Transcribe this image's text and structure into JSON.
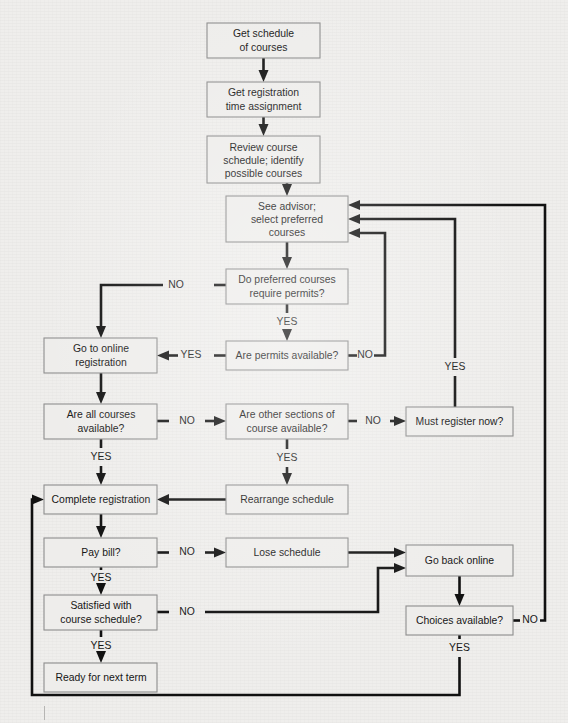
{
  "figure": {
    "type": "flowchart",
    "background_color": "#efeeec",
    "box_fill_color": "#eeedeb",
    "box_border_color": "#8d8d8d",
    "line_color": "#111111",
    "text_color": "#161616"
  },
  "nodes": [
    {
      "id": "get_schedule",
      "label": "Get schedule\nof courses",
      "lines": [
        "Get schedule",
        "of courses"
      ],
      "x": 207,
      "y": 23,
      "w": 113,
      "h": 35
    },
    {
      "id": "get_registration",
      "label": "Get registration\ntime assignment",
      "lines": [
        "Get registration",
        "time assignment"
      ],
      "x": 207,
      "y": 82,
      "w": 113,
      "h": 35
    },
    {
      "id": "review_course",
      "label": "Review  course\nschedule; identify\npossible courses",
      "lines": [
        "Review  course",
        "schedule; identify",
        "possible courses"
      ],
      "x": 207,
      "y": 136,
      "w": 113,
      "h": 47
    },
    {
      "id": "see_advisor",
      "label": "See advisor;\nselect preferred\ncourses",
      "lines": [
        "See advisor;",
        "select preferred",
        "courses"
      ],
      "x": 226,
      "y": 196,
      "w": 122,
      "h": 46
    },
    {
      "id": "require_permits",
      "label": "Do preferred courses\nrequire permits?",
      "lines": [
        "Do preferred courses",
        "require permits?"
      ],
      "x": 226,
      "y": 269,
      "w": 122,
      "h": 35
    },
    {
      "id": "permits_available",
      "label": "Are permits available?",
      "lines": [
        "Are permits available?"
      ],
      "x": 226,
      "y": 341,
      "w": 122,
      "h": 29
    },
    {
      "id": "go_online",
      "label": "Go to online\nregistration",
      "lines": [
        "Go to online",
        "registration"
      ],
      "x": 44,
      "y": 338,
      "w": 113,
      "h": 35
    },
    {
      "id": "all_courses",
      "label": "Are all courses\navailable?",
      "lines": [
        "Are all courses",
        "available?"
      ],
      "x": 44,
      "y": 404,
      "w": 113,
      "h": 35
    },
    {
      "id": "other_sections",
      "label": "Are other sections of\ncourse available?",
      "lines": [
        "Are other sections of",
        "course available?"
      ],
      "x": 226,
      "y": 404,
      "w": 122,
      "h": 35
    },
    {
      "id": "must_register",
      "label": "Must register now?",
      "lines": [
        "Must register now?"
      ],
      "x": 406,
      "y": 407,
      "w": 107,
      "h": 29
    },
    {
      "id": "complete_reg",
      "label": "Complete registration",
      "lines": [
        "Complete registration"
      ],
      "x": 44,
      "y": 485,
      "w": 113,
      "h": 29
    },
    {
      "id": "rearrange",
      "label": "Rearrange schedule",
      "lines": [
        "Rearrange schedule"
      ],
      "x": 226,
      "y": 485,
      "w": 122,
      "h": 29
    },
    {
      "id": "pay_bill",
      "label": "Pay bill?",
      "lines": [
        "Pay bill?"
      ],
      "x": 44,
      "y": 538,
      "w": 113,
      "h": 29
    },
    {
      "id": "lose_schedule",
      "label": "Lose schedule",
      "lines": [
        "Lose schedule"
      ],
      "x": 226,
      "y": 538,
      "w": 122,
      "h": 29
    },
    {
      "id": "go_back_online",
      "label": "Go back online",
      "lines": [
        "Go back online"
      ],
      "x": 406,
      "y": 545,
      "w": 107,
      "h": 31
    },
    {
      "id": "satisfied",
      "label": "Satisfied with\ncourse schedule?",
      "lines": [
        "Satisfied with",
        "course schedule?"
      ],
      "x": 44,
      "y": 595,
      "w": 113,
      "h": 35
    },
    {
      "id": "choices_available",
      "label": "Choices available?",
      "lines": [
        "Choices available?"
      ],
      "x": 406,
      "y": 606,
      "w": 107,
      "h": 29
    },
    {
      "id": "ready_next_term",
      "label": "Ready for next term",
      "lines": [
        "Ready for next term"
      ],
      "x": 44,
      "y": 663,
      "w": 113,
      "h": 29
    }
  ],
  "edge_labels": [
    {
      "id": "permits_no",
      "text": "NO",
      "x": 176,
      "y": 285
    },
    {
      "id": "permits_yes",
      "text": "YES",
      "x": 287,
      "y": 322
    },
    {
      "id": "permits_avail_yes",
      "text": "YES",
      "x": 191,
      "y": 356
    },
    {
      "id": "permits_avail_no",
      "text": "NO",
      "x": 365,
      "y": 356
    },
    {
      "id": "all_courses_no",
      "text": "NO",
      "x": 191,
      "y": 421
    },
    {
      "id": "all_courses_yes",
      "text": "YES",
      "x": 101,
      "y": 457
    },
    {
      "id": "sections_no",
      "text": "NO",
      "x": 376,
      "y": 421
    },
    {
      "id": "sections_yes",
      "text": "YES",
      "x": 287,
      "y": 458
    },
    {
      "id": "must_register_yes",
      "text": "YES",
      "x": 455,
      "y": 367
    },
    {
      "id": "pay_bill_no",
      "text": "NO",
      "x": 191,
      "y": 553
    },
    {
      "id": "pay_bill_yes",
      "text": "YES",
      "x": 101,
      "y": 578
    },
    {
      "id": "satisfied_no",
      "text": "NO",
      "x": 191,
      "y": 612
    },
    {
      "id": "satisfied_yes",
      "text": "YES",
      "x": 101,
      "y": 645
    },
    {
      "id": "choices_no",
      "text": "NO",
      "x": 530,
      "y": 621
    },
    {
      "id": "choices_yes",
      "text": "YES",
      "x": 432,
      "y": 648
    }
  ],
  "edges": [
    {
      "id": "e-get-schedule-to-get-registration",
      "from": "get_schedule",
      "to": "get_registration",
      "label": ""
    },
    {
      "id": "e-get-registration-to-review",
      "from": "get_registration",
      "to": "review_course",
      "label": ""
    },
    {
      "id": "e-review-to-see-advisor",
      "from": "review_course",
      "to": "see_advisor",
      "label": ""
    },
    {
      "id": "e-see-advisor-to-require-permits",
      "from": "see_advisor",
      "to": "require_permits",
      "label": ""
    },
    {
      "id": "e-require-permits-no-to-go-online",
      "from": "require_permits",
      "to": "go_online",
      "label": "NO"
    },
    {
      "id": "e-require-permits-yes-to-permits",
      "from": "require_permits",
      "to": "permits_available",
      "label": "YES"
    },
    {
      "id": "e-permits-yes-to-go-online",
      "from": "permits_available",
      "to": "go_online",
      "label": "YES"
    },
    {
      "id": "e-permits-no-to-see-advisor",
      "from": "permits_available",
      "to": "see_advisor",
      "label": "NO"
    },
    {
      "id": "e-go-online-to-all-courses",
      "from": "go_online",
      "to": "all_courses",
      "label": ""
    },
    {
      "id": "e-all-courses-no-to-sections",
      "from": "all_courses",
      "to": "other_sections",
      "label": "NO"
    },
    {
      "id": "e-all-courses-yes-to-complete",
      "from": "all_courses",
      "to": "complete_reg",
      "label": "YES"
    },
    {
      "id": "e-sections-no-to-must-register",
      "from": "other_sections",
      "to": "must_register",
      "label": "NO"
    },
    {
      "id": "e-sections-yes-to-rearrange",
      "from": "other_sections",
      "to": "rearrange",
      "label": "YES"
    },
    {
      "id": "e-must-register-yes-to-see-advisor",
      "from": "must_register",
      "to": "see_advisor",
      "label": "YES"
    },
    {
      "id": "e-rearrange-to-complete",
      "from": "rearrange",
      "to": "complete_reg",
      "label": ""
    },
    {
      "id": "e-complete-to-pay-bill",
      "from": "complete_reg",
      "to": "pay_bill",
      "label": ""
    },
    {
      "id": "e-pay-bill-no-to-lose",
      "from": "pay_bill",
      "to": "lose_schedule",
      "label": "NO"
    },
    {
      "id": "e-pay-bill-yes-to-satisfied",
      "from": "pay_bill",
      "to": "satisfied",
      "label": "YES"
    },
    {
      "id": "e-lose-to-go-back-online",
      "from": "lose_schedule",
      "to": "go_back_online",
      "label": ""
    },
    {
      "id": "e-satisfied-no-to-go-back-online",
      "from": "satisfied",
      "to": "go_back_online",
      "label": "NO"
    },
    {
      "id": "e-satisfied-yes-to-ready",
      "from": "satisfied",
      "to": "ready_next_term",
      "label": "YES"
    },
    {
      "id": "e-go-back-online-to-choices",
      "from": "go_back_online",
      "to": "choices_available",
      "label": ""
    },
    {
      "id": "e-choices-no-to-see-advisor",
      "from": "choices_available",
      "to": "see_advisor",
      "label": "NO"
    },
    {
      "id": "e-choices-yes-to-complete",
      "from": "choices_available",
      "to": "complete_reg",
      "label": "YES"
    }
  ]
}
